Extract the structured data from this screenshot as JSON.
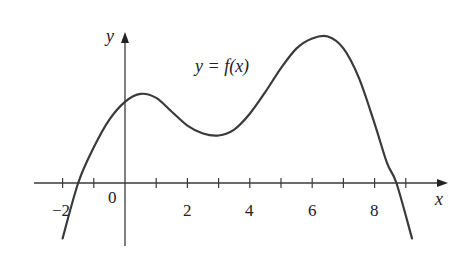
{
  "chart_data": {
    "type": "line",
    "title": "",
    "curve_label": "y = f(x)",
    "xlabel": "x",
    "ylabel": "y",
    "xlim": [
      -2.3,
      10.5
    ],
    "x_tick_step": 1,
    "x_tick_labels": [
      "-2",
      "0",
      "2",
      "4",
      "6",
      "8"
    ],
    "grid": false,
    "legend": "none",
    "series": [
      {
        "name": "f(x)",
        "points": [
          {
            "x": -2.0,
            "y": -2.8
          },
          {
            "x": -1.5,
            "y": 0.0
          },
          {
            "x": -1.0,
            "y": 1.8
          },
          {
            "x": -0.5,
            "y": 3.2
          },
          {
            "x": 0.0,
            "y": 4.1
          },
          {
            "x": 0.5,
            "y": 4.5
          },
          {
            "x": 1.0,
            "y": 4.3
          },
          {
            "x": 1.5,
            "y": 3.6
          },
          {
            "x": 2.0,
            "y": 2.9
          },
          {
            "x": 2.5,
            "y": 2.5
          },
          {
            "x": 3.0,
            "y": 2.4
          },
          {
            "x": 3.5,
            "y": 2.7
          },
          {
            "x": 4.0,
            "y": 3.5
          },
          {
            "x": 4.5,
            "y": 4.6
          },
          {
            "x": 5.0,
            "y": 5.8
          },
          {
            "x": 5.5,
            "y": 6.8
          },
          {
            "x": 6.0,
            "y": 7.3
          },
          {
            "x": 6.5,
            "y": 7.4
          },
          {
            "x": 7.0,
            "y": 6.8
          },
          {
            "x": 7.5,
            "y": 5.3
          },
          {
            "x": 8.0,
            "y": 3.0
          },
          {
            "x": 8.4,
            "y": 1.0
          },
          {
            "x": 8.7,
            "y": 0.0
          },
          {
            "x": 9.2,
            "y": -2.8
          }
        ]
      }
    ],
    "features": {
      "roots": [
        -1.5,
        8.7
      ],
      "local_max": {
        "x": 0.5,
        "y": 4.5
      },
      "local_min": {
        "x": 3.0,
        "y": 2.4
      },
      "global_max": {
        "x": 6.5,
        "y": 7.4
      }
    }
  },
  "labels": {
    "y_axis": "y",
    "x_axis": "x",
    "curve": "y = f(x)",
    "ticks": [
      "−2",
      "0",
      "2",
      "4",
      "6",
      "8"
    ]
  },
  "colors": {
    "curve": "#3a3a3a",
    "axes": "#3a3a3a",
    "text": "#222222"
  }
}
